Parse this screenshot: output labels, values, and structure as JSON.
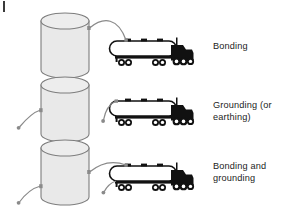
{
  "figure": {
    "corner_mark": "crop-tick-mark",
    "background_color": "#ffffff",
    "ink_color": "#1c1c1c",
    "tank_fill_color": "#e9e9e9",
    "tank_stroke_color": "#7d7d7d",
    "wire_color": "#8a8a8a",
    "truck_body_color": "#ffffff",
    "truck_cab_color": "#111111"
  },
  "rows": [
    {
      "id": "bonding",
      "label": "Bonding",
      "storage_tank": "vertical-storage-tank",
      "vehicle": "tank-truck",
      "wires": [
        {
          "name": "bonding-wire",
          "from": "storage-tank",
          "to": "tank-truck",
          "endpoints": [
            "tank-terminal",
            "trailer-terminal"
          ]
        }
      ],
      "ground_rods": 0
    },
    {
      "id": "grounding",
      "label": "Grounding (or\nearthing)",
      "storage_tank": "vertical-storage-tank",
      "vehicle": "tank-truck",
      "wires": [
        {
          "name": "tank-ground-wire",
          "from": "storage-tank",
          "to": "earth-ground",
          "endpoints": [
            "tank-terminal",
            "ground-point"
          ]
        },
        {
          "name": "truck-ground-wire",
          "from": "tank-truck",
          "to": "earth-ground",
          "endpoints": [
            "trailer-terminal",
            "ground-point"
          ]
        }
      ],
      "ground_rods": 2
    },
    {
      "id": "bonding-and-grounding",
      "label": "Bonding and\ngrounding",
      "storage_tank": "vertical-storage-tank",
      "vehicle": "tank-truck",
      "wires": [
        {
          "name": "bonding-wire",
          "from": "storage-tank",
          "to": "tank-truck",
          "endpoints": [
            "tank-terminal",
            "trailer-terminal"
          ]
        },
        {
          "name": "tank-ground-wire",
          "from": "storage-tank",
          "to": "earth-ground",
          "endpoints": [
            "tank-terminal",
            "ground-point"
          ]
        },
        {
          "name": "truck-ground-wire",
          "from": "tank-truck",
          "to": "earth-ground",
          "endpoints": [
            "trailer-terminal",
            "ground-point"
          ]
        }
      ],
      "ground_rods": 2
    }
  ]
}
